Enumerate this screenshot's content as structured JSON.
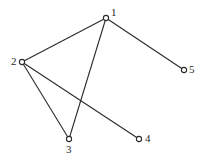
{
  "diagram": {
    "type": "undirected-graph",
    "nodes": [
      {
        "id": "1",
        "label": "1",
        "x": 106,
        "y": 18,
        "label_x": 111,
        "label_y": 16
      },
      {
        "id": "2",
        "label": "2",
        "x": 22,
        "y": 62,
        "label_x": 11,
        "label_y": 65
      },
      {
        "id": "3",
        "label": "3",
        "x": 69,
        "y": 139,
        "label_x": 66,
        "label_y": 153
      },
      {
        "id": "4",
        "label": "4",
        "x": 139,
        "y": 139,
        "label_x": 145,
        "label_y": 142
      },
      {
        "id": "5",
        "label": "5",
        "x": 184,
        "y": 70,
        "label_x": 189,
        "label_y": 73
      }
    ],
    "edges": [
      {
        "from": "1",
        "to": "2"
      },
      {
        "from": "1",
        "to": "3"
      },
      {
        "from": "1",
        "to": "5"
      },
      {
        "from": "2",
        "to": "3"
      },
      {
        "from": "2",
        "to": "4"
      }
    ],
    "colors": {
      "stroke": "#2a2a2a",
      "background": "#ffffff"
    }
  }
}
